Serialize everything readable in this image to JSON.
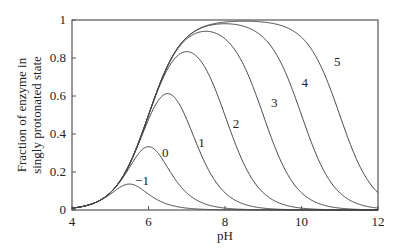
{
  "chart_data": {
    "type": "line",
    "title": "",
    "xlabel": "pH",
    "ylabel": "Fraction of enzyme in singly protonated state",
    "ylabel_lines": [
      "Fraction of enzyme in",
      "singly protonated state"
    ],
    "xlim": [
      4,
      12
    ],
    "ylim": [
      0,
      1
    ],
    "xticks": [
      4,
      6,
      8,
      10,
      12
    ],
    "xtick_labels": [
      "4",
      "6",
      "8",
      "10",
      "12"
    ],
    "yticks": [
      0,
      0.2,
      0.4,
      0.6,
      0.8,
      1
    ],
    "ytick_labels": [
      "0",
      "0.2",
      "0.4",
      "0.6",
      "0.8",
      "1"
    ],
    "grid": false,
    "legend": "none (curves labeled inline)",
    "model": "f = 1 / (1 + 10^(pKa1 - pH) + 10^(pH - pKa2)), pKa1 = 6, pKa2 = 6 + label",
    "pKa1": 6,
    "series": [
      {
        "name": "-1",
        "pKa2": 5,
        "peak_pH": 5.5,
        "peak_value": 0.14,
        "label_pos": [
          5.65,
          0.13
        ]
      },
      {
        "name": "0",
        "pKa2": 6,
        "peak_pH": 6.0,
        "peak_value": 0.33,
        "label_pos": [
          6.35,
          0.28
        ]
      },
      {
        "name": "1",
        "pKa2": 7,
        "peak_pH": 6.5,
        "peak_value": 0.61,
        "label_pos": [
          7.3,
          0.33
        ]
      },
      {
        "name": "2",
        "pKa2": 8,
        "peak_pH": 7.0,
        "peak_value": 0.83,
        "label_pos": [
          8.2,
          0.43
        ]
      },
      {
        "name": "3",
        "pKa2": 9,
        "peak_pH": 7.5,
        "peak_value": 0.94,
        "label_pos": [
          9.2,
          0.54
        ]
      },
      {
        "name": "4",
        "pKa2": 10,
        "peak_pH": 8.0,
        "peak_value": 0.98,
        "label_pos": [
          10.0,
          0.65
        ]
      },
      {
        "name": "5",
        "pKa2": 11,
        "peak_pH": 8.5,
        "peak_value": 0.99,
        "label_pos": [
          10.85,
          0.76
        ]
      }
    ]
  },
  "style": {
    "line_color": "#444444",
    "axis_color": "#555555"
  }
}
